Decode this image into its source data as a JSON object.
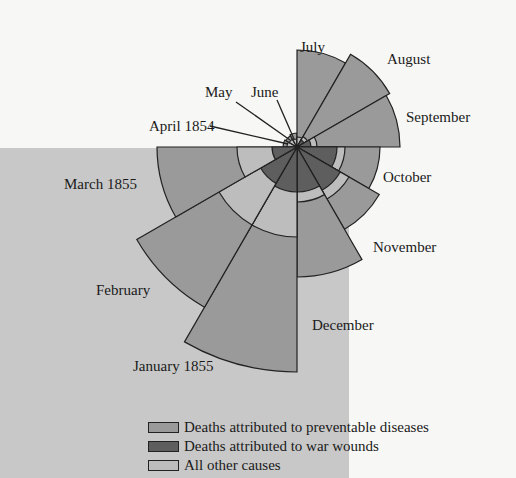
{
  "chart_data": {
    "type": "polar-area",
    "title": "",
    "center": [
      297,
      147
    ],
    "categories": [
      "April 1854",
      "May",
      "June",
      "July",
      "August",
      "September",
      "October",
      "November",
      "December",
      "January 1855",
      "February",
      "March 1855"
    ],
    "series": [
      {
        "name": "Deaths attributed to preventable diseases",
        "color": "#9a9a9a",
        "radii": [
          14,
          13,
          14,
          97,
          107,
          103,
          83,
          95,
          130,
          225,
          185,
          140
        ]
      },
      {
        "name": "Deaths attributed to war wounds",
        "color": "#5e5e5e",
        "radii": [
          0,
          0,
          0,
          0,
          8,
          14,
          40,
          50,
          45,
          45,
          42,
          25
        ]
      },
      {
        "name": "All other causes",
        "color": "#bdbdbd",
        "radii": [
          10,
          9,
          8,
          10,
          12,
          20,
          48,
          60,
          55,
          90,
          90,
          60
        ]
      }
    ],
    "start_angle_deg": 180,
    "direction": "clockwise",
    "legend_position": "bottom"
  },
  "labels": [
    {
      "text": "July",
      "x": 300,
      "y": 40
    },
    {
      "text": "August",
      "x": 387,
      "y": 52
    },
    {
      "text": "May",
      "x": 205,
      "y": 85
    },
    {
      "text": "June",
      "x": 251,
      "y": 85
    },
    {
      "text": "September",
      "x": 406,
      "y": 110
    },
    {
      "text": "April 1854",
      "x": 149,
      "y": 119
    },
    {
      "text": "March 1855",
      "x": 64,
      "y": 177
    },
    {
      "text": "October",
      "x": 383,
      "y": 170
    },
    {
      "text": "November",
      "x": 373,
      "y": 240
    },
    {
      "text": "February",
      "x": 96,
      "y": 283
    },
    {
      "text": "December",
      "x": 312,
      "y": 318
    },
    {
      "text": "January 1855",
      "x": 133,
      "y": 359
    }
  ],
  "legend": [
    {
      "label": "Deaths attributed to preventable diseases",
      "color": "#9a9a9a"
    },
    {
      "label": "Deaths attributed to war wounds",
      "color": "#5e5e5e"
    },
    {
      "label": "All other causes",
      "color": "#bdbdbd"
    }
  ]
}
